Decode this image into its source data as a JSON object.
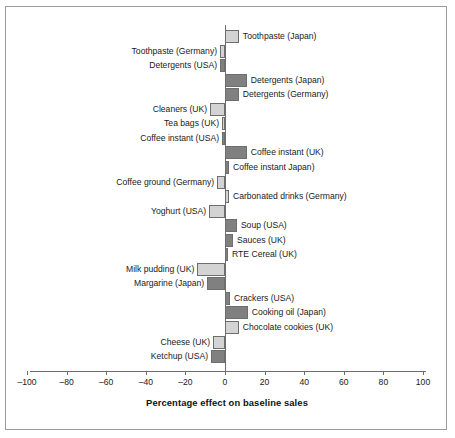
{
  "chart_data": {
    "type": "bar",
    "orientation": "horizontal",
    "title": "",
    "xlabel": "Percentage effect on baseline sales",
    "ylabel": "",
    "xlim": [
      -100,
      100
    ],
    "xticks": [
      -100,
      -80,
      -60,
      -40,
      -20,
      0,
      20,
      40,
      60,
      80,
      100
    ],
    "xticklabels": [
      "–100",
      "–80",
      "–60",
      "–40",
      "–20",
      "0",
      "20",
      "40",
      "60",
      "80",
      "100"
    ],
    "grid": false,
    "legend": false,
    "colors": {
      "light": "#d3d3d3",
      "dark": "#808080",
      "outline": "#6e6e6e",
      "axis": "#6e6e6e",
      "text": "#1a1a1a",
      "frame": "#9b9b9b"
    },
    "categories": [
      "Toothpaste (Japan)",
      "Toothpaste (Germany)",
      "Detergents (USA)",
      "Detergents (Japan)",
      "Detergents (Germany)",
      "Cleaners (UK)",
      "Tea bags (UK)",
      "Coffee instant (USA)",
      "Coffee instant (UK)",
      "Coffee instant Japan)",
      "Coffee ground (Germany)",
      "Carbonated drinks (Germany)",
      "Yoghurt (USA)",
      "Soup (USA)",
      "Sauces (UK)",
      "RTE Cereal (UK)",
      "Milk pudding (UK)",
      "Margarine (Japan)",
      "Crackers (USA)",
      "Cooking oil (Japan)",
      "Chocolate cookies (UK)",
      "Cheese (UK)",
      "Ketchup (USA)"
    ],
    "values": [
      7,
      -2.5,
      -2.5,
      11,
      7,
      -7.5,
      -1.5,
      -1.5,
      11,
      2,
      -4,
      2,
      -8,
      6,
      4,
      1.5,
      -14,
      -9,
      2.5,
      11.5,
      7,
      -6,
      -7
    ],
    "shades": [
      "light",
      "light",
      "dark",
      "dark",
      "dark",
      "light",
      "light",
      "dark",
      "dark",
      "dark",
      "light",
      "light",
      "light",
      "dark",
      "dark",
      "dark",
      "light",
      "dark",
      "dark",
      "dark",
      "light",
      "light",
      "dark"
    ],
    "bars": [
      {
        "label": "Toothpaste (Japan)",
        "value": 7,
        "shade": "light",
        "label_side": "right"
      },
      {
        "label": "Toothpaste (Germany)",
        "value": -2.5,
        "shade": "light",
        "label_side": "left"
      },
      {
        "label": "Detergents (USA)",
        "value": -2.5,
        "shade": "dark",
        "label_side": "left"
      },
      {
        "label": "Detergents (Japan)",
        "value": 11,
        "shade": "dark",
        "label_side": "right"
      },
      {
        "label": "Detergents (Germany)",
        "value": 7,
        "shade": "dark",
        "label_side": "right"
      },
      {
        "label": "Cleaners (UK)",
        "value": -7.5,
        "shade": "light",
        "label_side": "left"
      },
      {
        "label": "Tea bags (UK)",
        "value": -1.5,
        "shade": "light",
        "label_side": "left"
      },
      {
        "label": "Coffee instant (USA)",
        "value": -1.5,
        "shade": "dark",
        "label_side": "left"
      },
      {
        "label": "Coffee instant (UK)",
        "value": 11,
        "shade": "dark",
        "label_side": "right"
      },
      {
        "label": "Coffee instant Japan)",
        "value": 2,
        "shade": "dark",
        "label_side": "right"
      },
      {
        "label": "Coffee ground (Germany)",
        "value": -4,
        "shade": "light",
        "label_side": "left"
      },
      {
        "label": "Carbonated drinks (Germany)",
        "value": 2,
        "shade": "light",
        "label_side": "right"
      },
      {
        "label": "Yoghurt (USA)",
        "value": -8,
        "shade": "light",
        "label_side": "left"
      },
      {
        "label": "Soup (USA)",
        "value": 6,
        "shade": "dark",
        "label_side": "right"
      },
      {
        "label": "Sauces (UK)",
        "value": 4,
        "shade": "dark",
        "label_side": "right"
      },
      {
        "label": "RTE Cereal (UK)",
        "value": 1.5,
        "shade": "dark",
        "label_side": "right"
      },
      {
        "label": "Milk pudding (UK)",
        "value": -14,
        "shade": "light",
        "label_side": "left"
      },
      {
        "label": "Margarine (Japan)",
        "value": -9,
        "shade": "dark",
        "label_side": "left"
      },
      {
        "label": "Crackers (USA)",
        "value": 2.5,
        "shade": "dark",
        "label_side": "right"
      },
      {
        "label": "Cooking oil (Japan)",
        "value": 11.5,
        "shade": "dark",
        "label_side": "right"
      },
      {
        "label": "Chocolate cookies (UK)",
        "value": 7,
        "shade": "light",
        "label_side": "right"
      },
      {
        "label": "Cheese (UK)",
        "value": -6,
        "shade": "light",
        "label_side": "left"
      },
      {
        "label": "Ketchup (USA)",
        "value": -7,
        "shade": "dark",
        "label_side": "left"
      }
    ]
  }
}
